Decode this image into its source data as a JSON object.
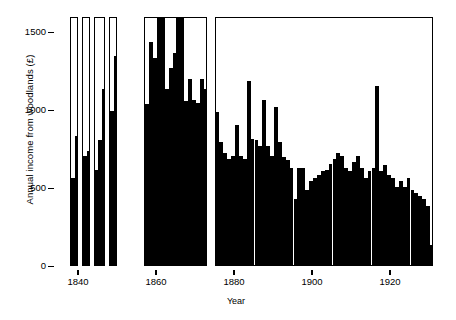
{
  "chart_data": {
    "type": "bar",
    "title": "",
    "xlabel": "Year",
    "ylabel": "Annual income from woodlands (£)",
    "xlim": [
      1836,
      1931
    ],
    "ylim": [
      0,
      1600
    ],
    "yticks": [
      0,
      500,
      1000,
      1500
    ],
    "ytick_labels": [
      "0",
      "500",
      "1000",
      "1500"
    ],
    "xticks": [
      1840,
      1860,
      1880,
      1900,
      1920
    ],
    "xtick_labels": [
      "1840",
      "1860",
      "1880",
      "1900",
      "1920"
    ],
    "grid": false,
    "legend": null,
    "bar_color": "#000000",
    "background": "#ffffff",
    "note": "Discontinuous record: data drawn inside separate bordered panels separated by gaps where no records survive.",
    "panels": [
      {
        "name": "panel-1",
        "x_start": 1838,
        "x_end": 1840,
        "years": [
          1838,
          1839
        ],
        "values": [
          560,
          830
        ]
      },
      {
        "name": "panel-2",
        "x_start": 1841,
        "x_end": 1843,
        "years": [
          1841,
          1842
        ],
        "values": [
          700,
          730
        ]
      },
      {
        "name": "panel-3",
        "x_start": 1844,
        "x_end": 1847,
        "years": [
          1844,
          1845,
          1846
        ],
        "values": [
          610,
          800,
          1130
        ]
      },
      {
        "name": "panel-4",
        "x_start": 1848,
        "x_end": 1850,
        "years": [
          1848,
          1849
        ],
        "values": [
          990,
          1340
        ]
      },
      {
        "name": "panel-5",
        "x_start": 1857,
        "x_end": 1862,
        "years": [
          1857,
          1858,
          1859,
          1860,
          1861
        ],
        "values": [
          1030,
          1430,
          1330,
          1590,
          1590
        ]
      },
      {
        "name": "panel-6",
        "x_start": 1862,
        "x_end": 1867,
        "years": [
          1862,
          1863,
          1864,
          1865,
          1866
        ],
        "values": [
          1130,
          1260,
          1360,
          1590,
          1590
        ]
      },
      {
        "name": "panel-7",
        "x_start": 1867,
        "x_end": 1873,
        "years": [
          1867,
          1868,
          1869,
          1870,
          1871,
          1872
        ],
        "values": [
          1050,
          1190,
          1060,
          1040,
          1190,
          1130
        ]
      },
      {
        "name": "panel-8",
        "x_start": 1875,
        "x_end": 1931,
        "years": [
          1875,
          1876,
          1877,
          1878,
          1879,
          1880,
          1881,
          1882,
          1883,
          1884,
          1885,
          1886,
          1887,
          1888,
          1889,
          1890,
          1891,
          1892,
          1893,
          1894,
          1895,
          1896,
          1897,
          1898,
          1899,
          1900,
          1901,
          1902,
          1903,
          1904,
          1905,
          1906,
          1907,
          1908,
          1909,
          1910,
          1911,
          1912,
          1913,
          1914,
          1915,
          1916,
          1917,
          1918,
          1919,
          1920,
          1921,
          1922,
          1923,
          1924,
          1925,
          1926,
          1927,
          1928,
          1929,
          1930
        ],
        "values": [
          980,
          790,
          720,
          680,
          700,
          900,
          700,
          680,
          1180,
          810,
          800,
          760,
          1060,
          760,
          700,
          1010,
          790,
          690,
          670,
          620,
          420,
          620,
          620,
          480,
          540,
          560,
          580,
          600,
          610,
          650,
          680,
          720,
          700,
          620,
          600,
          660,
          700,
          620,
          560,
          600,
          620,
          1150,
          600,
          640,
          580,
          560,
          500,
          540,
          500,
          560,
          480,
          460,
          440,
          420,
          380,
          130
        ]
      }
    ]
  }
}
